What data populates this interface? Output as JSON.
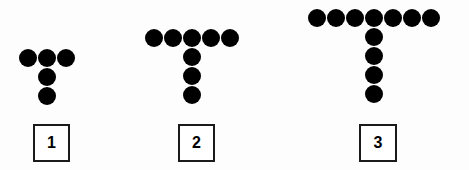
{
  "canvas": {
    "width": 469,
    "height": 170,
    "background_color": "#fdfdfd",
    "dot_color": "#000000",
    "box_border_color": "#1a1a1a",
    "box_fill_color": "#ffffff"
  },
  "figures": [
    {
      "label": "1",
      "top_row_count": 3,
      "stem_count": 2,
      "total_dots": 5,
      "dot_diameter": 18,
      "row_spacing": 19,
      "col_spacing": 19,
      "origin_x": 19,
      "origin_y": 49,
      "box": {
        "x": 33,
        "y": 124,
        "width": 37,
        "height": 38
      }
    },
    {
      "label": "2",
      "top_row_count": 5,
      "stem_count": 3,
      "total_dots": 8,
      "dot_diameter": 18,
      "row_spacing": 19,
      "col_spacing": 19,
      "origin_x": 145,
      "origin_y": 29,
      "box": {
        "x": 178,
        "y": 124,
        "width": 37,
        "height": 38
      }
    },
    {
      "label": "3",
      "top_row_count": 7,
      "stem_count": 4,
      "total_dots": 11,
      "dot_diameter": 18,
      "row_spacing": 19,
      "col_spacing": 19,
      "origin_x": 308,
      "origin_y": 9,
      "box": {
        "x": 359,
        "y": 124,
        "width": 38,
        "height": 38
      }
    }
  ]
}
